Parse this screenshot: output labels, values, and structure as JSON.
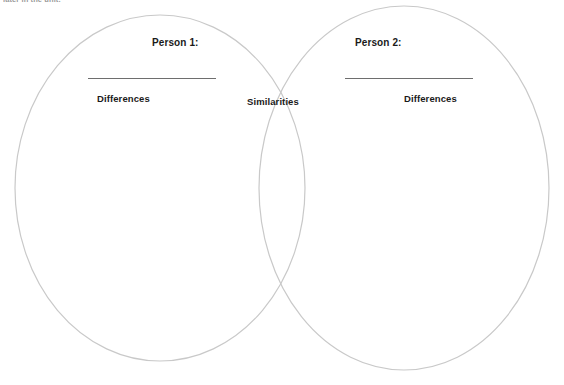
{
  "page": {
    "clipped_header_text": "later in the unit.",
    "background_color": "#ffffff"
  },
  "diagram": {
    "type": "venn",
    "stroke_color": "#c9c9c9",
    "text_color": "#1a1a1a",
    "rule_color": "#6e6e6e",
    "left_circle": {
      "center_x": 160,
      "center_y": 188,
      "radius_x": 145,
      "radius_y": 173,
      "heading": "Person 1:",
      "region_label": "Differences"
    },
    "right_circle": {
      "center_x": 404,
      "center_y": 188,
      "radius_x": 145,
      "radius_y": 182,
      "heading": "Person 2:",
      "region_label": "Differences"
    },
    "overlap": {
      "label": "Similarities"
    }
  }
}
